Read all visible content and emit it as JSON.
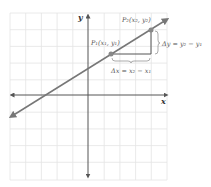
{
  "diagram": {
    "axes": {
      "x_label": "x",
      "y_label": "y"
    },
    "grid": {
      "columns": 10,
      "rows": 10,
      "color": "#e2e2e2"
    },
    "line": {
      "color": "#777777"
    },
    "points": [
      {
        "id": "P1",
        "label": "P₁(x₁, y₁)"
      },
      {
        "id": "P2",
        "label": "P₂(x₂, y₂)"
      }
    ],
    "annotations": {
      "delta_x": "Δx = x₂ − x₁",
      "delta_y": "Δy = y₂ − y₁"
    },
    "colors": {
      "axis": "#555555",
      "triangle": "#555555",
      "point": "#888888"
    }
  }
}
